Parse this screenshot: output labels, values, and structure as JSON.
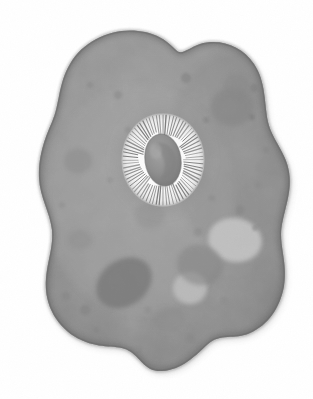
{
  "figure": {
    "title": "Amoeba (Amoeba proteus) cell",
    "style": "grayscale scientific illustration, watercolor wash and stipple",
    "canvas": {
      "width": 313,
      "height": 399
    },
    "background_color": "#ffffff",
    "has_text_labels": false,
    "label_text": ""
  },
  "colors": {
    "background": "#ffffff",
    "cytoplasm_base": "#989898",
    "cytoplasm_light": "#a6a6a6",
    "membrane_rim": "#6e6e6e",
    "membrane_rim_dark": "#5e5e5e",
    "vacuole_dark": "#7c7c7c",
    "vacuole_darker": "#707070",
    "vacuole_light": "#bcbcbc",
    "vacuole_lighter": "#c6c6c6",
    "granule_mid": "#8a8a8a",
    "nucleus_halo": "#f4f4f4",
    "nucleus_core": "#8f8f8f",
    "nucleus_core_dark": "#7b7b7b",
    "nucleus_spoke": "#6a6a6a"
  },
  "cell": {
    "name": "amoeba-body",
    "description": "irregular amorphous blob with rounded pseudopod lobes",
    "bounds": {
      "x": 38,
      "y": 30,
      "width": 252,
      "height": 342
    },
    "lobes": [
      {
        "name": "top-left-lobe",
        "cx": 120,
        "cy": 58
      },
      {
        "name": "top-right-lobe",
        "cx": 225,
        "cy": 60
      },
      {
        "name": "right-lobe",
        "cx": 285,
        "cy": 190
      },
      {
        "name": "bottom-right-lobe",
        "cx": 240,
        "cy": 330
      },
      {
        "name": "bottom-center-lobe",
        "cx": 150,
        "cy": 368
      },
      {
        "name": "bottom-left-lobe",
        "cx": 62,
        "cy": 300
      },
      {
        "name": "left-lobe",
        "cx": 42,
        "cy": 185
      }
    ]
  },
  "nucleus": {
    "name": "nucleus",
    "center": {
      "x": 163,
      "y": 160
    },
    "halo_radius": {
      "rx": 41,
      "ry": 46
    },
    "core_radius": {
      "rx": 17,
      "ry": 25
    },
    "core_rotation_deg": -8,
    "spoke_count": 72,
    "description": "oval nucleus with bright white striated halo and darker kidney-shaped karyosome"
  },
  "vacuoles": [
    {
      "name": "food-vacuole-large-dark",
      "cx": 124,
      "cy": 283,
      "rx": 30,
      "ry": 23,
      "rot": -35,
      "fill": "#7c7c7c",
      "opacity": 0.85
    },
    {
      "name": "contractile-vacuole-right",
      "cx": 235,
      "cy": 240,
      "rx": 27,
      "ry": 22,
      "rot": 10,
      "fill": "#c2c2c2",
      "opacity": 0.95
    },
    {
      "name": "contractile-vacuole-lower",
      "cx": 190,
      "cy": 288,
      "rx": 17,
      "ry": 16,
      "rot": 0,
      "fill": "#bcbcbc",
      "opacity": 0.95
    },
    {
      "name": "food-vacuole-mid-gray",
      "cx": 200,
      "cy": 265,
      "rx": 23,
      "ry": 20,
      "rot": 15,
      "fill": "#878787",
      "opacity": 0.6
    },
    {
      "name": "food-vacuole-upper-right",
      "cx": 232,
      "cy": 107,
      "rx": 21,
      "ry": 19,
      "rot": 0,
      "fill": "#868686",
      "opacity": 0.6
    },
    {
      "name": "food-vacuole-upper-right-2",
      "cx": 236,
      "cy": 85,
      "rx": 13,
      "ry": 11,
      "rot": 0,
      "fill": "#8a8a8a",
      "opacity": 0.5
    },
    {
      "name": "food-vacuole-left",
      "cx": 78,
      "cy": 161,
      "rx": 14,
      "ry": 12,
      "rot": 0,
      "fill": "#8c8c8c",
      "opacity": 0.5
    },
    {
      "name": "food-vacuole-left-2",
      "cx": 80,
      "cy": 240,
      "rx": 12,
      "ry": 10,
      "rot": 0,
      "fill": "#8e8e8e",
      "opacity": 0.45
    },
    {
      "name": "food-vacuole-bottom",
      "cx": 170,
      "cy": 320,
      "rx": 16,
      "ry": 13,
      "rot": 0,
      "fill": "#8c8c8c",
      "opacity": 0.45
    },
    {
      "name": "food-vacuole-center",
      "cx": 150,
      "cy": 215,
      "rx": 15,
      "ry": 13,
      "rot": 0,
      "fill": "#909090",
      "opacity": 0.4
    }
  ],
  "granules": [
    {
      "cx": 186,
      "cy": 78,
      "r": 5,
      "fill": "#848484",
      "opacity": 0.6
    },
    {
      "cx": 254,
      "cy": 88,
      "r": 4,
      "fill": "#828282",
      "opacity": 0.6
    },
    {
      "cx": 252,
      "cy": 117,
      "r": 3,
      "fill": "#7e7e7e",
      "opacity": 0.6
    },
    {
      "cx": 206,
      "cy": 120,
      "r": 3,
      "fill": "#828282",
      "opacity": 0.5
    },
    {
      "cx": 118,
      "cy": 95,
      "r": 4,
      "fill": "#888888",
      "opacity": 0.5
    },
    {
      "cx": 90,
      "cy": 85,
      "r": 3,
      "fill": "#8a8a8a",
      "opacity": 0.5
    },
    {
      "cx": 240,
      "cy": 210,
      "r": 4,
      "fill": "#868686",
      "opacity": 0.5
    },
    {
      "cx": 255,
      "cy": 228,
      "r": 3,
      "fill": "#858585",
      "opacity": 0.5
    },
    {
      "cx": 212,
      "cy": 198,
      "r": 3,
      "fill": "#888888",
      "opacity": 0.45
    },
    {
      "cx": 198,
      "cy": 232,
      "r": 4,
      "fill": "#898989",
      "opacity": 0.45
    },
    {
      "cx": 85,
      "cy": 310,
      "r": 5,
      "fill": "#838383",
      "opacity": 0.55
    },
    {
      "cx": 66,
      "cy": 296,
      "r": 4,
      "fill": "#858585",
      "opacity": 0.5
    },
    {
      "cx": 96,
      "cy": 330,
      "r": 3,
      "fill": "#868686",
      "opacity": 0.5
    },
    {
      "cx": 148,
      "cy": 310,
      "r": 3,
      "fill": "#8a8a8a",
      "opacity": 0.45
    },
    {
      "cx": 190,
      "cy": 338,
      "r": 4,
      "fill": "#888888",
      "opacity": 0.45
    },
    {
      "cx": 224,
      "cy": 300,
      "r": 3,
      "fill": "#8a8a8a",
      "opacity": 0.4
    },
    {
      "cx": 62,
      "cy": 205,
      "r": 3,
      "fill": "#8c8c8c",
      "opacity": 0.4
    },
    {
      "cx": 110,
      "cy": 180,
      "r": 3,
      "fill": "#8e8e8e",
      "opacity": 0.4
    },
    {
      "cx": 128,
      "cy": 130,
      "r": 3,
      "fill": "#8a8a8a",
      "opacity": 0.4
    },
    {
      "cx": 266,
      "cy": 150,
      "r": 3,
      "fill": "#868686",
      "opacity": 0.45
    },
    {
      "cx": 258,
      "cy": 185,
      "r": 3,
      "fill": "#888888",
      "opacity": 0.4
    },
    {
      "cx": 140,
      "cy": 348,
      "r": 3,
      "fill": "#898989",
      "opacity": 0.4
    }
  ]
}
